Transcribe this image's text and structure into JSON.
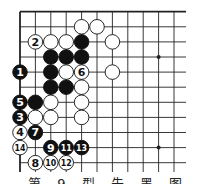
{
  "diagram": {
    "type": "go-board-corner",
    "grid": {
      "x0": 20,
      "y0": 11.7,
      "dx": 15.4,
      "dy": 15.1,
      "cols": 11,
      "rows": 11,
      "right_extent": 186,
      "bottom_extent": 172
    },
    "colors": {
      "line": "#222222",
      "black": "#111111",
      "white": "#ffffff",
      "background": "#ffffff"
    },
    "star_points": [
      {
        "col": 9,
        "row": 3
      },
      {
        "col": 9,
        "row": 9
      }
    ],
    "stones": [
      {
        "col": 4,
        "row": 1,
        "color": "white",
        "label": ""
      },
      {
        "col": 5,
        "row": 1,
        "color": "white",
        "label": ""
      },
      {
        "col": 1,
        "row": 2,
        "color": "white",
        "label": "2"
      },
      {
        "col": 2,
        "row": 2,
        "color": "white",
        "label": ""
      },
      {
        "col": 3,
        "row": 2,
        "color": "white",
        "label": ""
      },
      {
        "col": 4,
        "row": 2,
        "color": "black",
        "label": ""
      },
      {
        "col": 6,
        "row": 2,
        "color": "white",
        "label": ""
      },
      {
        "col": 2,
        "row": 3,
        "color": "black",
        "label": ""
      },
      {
        "col": 3,
        "row": 3,
        "color": "black",
        "label": ""
      },
      {
        "col": 4,
        "row": 3,
        "color": "black",
        "label": ""
      },
      {
        "col": 0,
        "row": 4,
        "color": "black",
        "label": "1"
      },
      {
        "col": 2,
        "row": 4,
        "color": "black",
        "label": ""
      },
      {
        "col": 3,
        "row": 4,
        "color": "white",
        "label": ""
      },
      {
        "col": 4,
        "row": 4,
        "color": "white",
        "label": "6"
      },
      {
        "col": 6,
        "row": 4,
        "color": "white",
        "label": ""
      },
      {
        "col": 2,
        "row": 5,
        "color": "black",
        "label": ""
      },
      {
        "col": 3,
        "row": 5,
        "color": "black",
        "label": ""
      },
      {
        "col": 4,
        "row": 5,
        "color": "white",
        "label": ""
      },
      {
        "col": 0,
        "row": 6,
        "color": "black",
        "label": "5"
      },
      {
        "col": 1,
        "row": 6,
        "color": "black",
        "label": ""
      },
      {
        "col": 2,
        "row": 6,
        "color": "white",
        "label": ""
      },
      {
        "col": 4,
        "row": 6,
        "color": "white",
        "label": ""
      },
      {
        "col": 0,
        "row": 7,
        "color": "black",
        "label": "3"
      },
      {
        "col": 1,
        "row": 7,
        "color": "white",
        "label": ""
      },
      {
        "col": 2,
        "row": 7,
        "color": "white",
        "label": ""
      },
      {
        "col": 4,
        "row": 7,
        "color": "white",
        "label": ""
      },
      {
        "col": 0,
        "row": 8,
        "color": "white",
        "label": "4"
      },
      {
        "col": 1,
        "row": 8,
        "color": "black",
        "label": "7"
      },
      {
        "col": 0,
        "row": 9,
        "color": "white",
        "label": "14"
      },
      {
        "col": 2,
        "row": 9,
        "color": "black",
        "label": "9"
      },
      {
        "col": 3,
        "row": 9,
        "color": "black",
        "label": "11"
      },
      {
        "col": 4,
        "row": 9,
        "color": "black",
        "label": "13"
      },
      {
        "col": 1,
        "row": 10,
        "color": "white",
        "label": "8"
      },
      {
        "col": 2,
        "row": 10,
        "color": "white",
        "label": "10"
      },
      {
        "col": 3,
        "row": 10,
        "color": "white",
        "label": "12"
      }
    ]
  },
  "caption": {
    "text": "第 9 型 先 黑 图 … 题"
  }
}
